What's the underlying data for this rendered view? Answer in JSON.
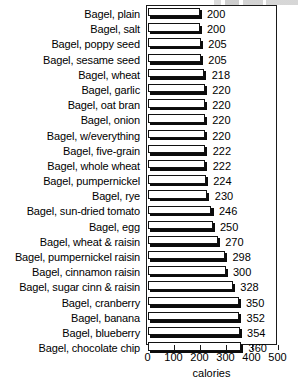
{
  "chart_data": {
    "type": "bar",
    "orientation": "horizontal",
    "title": "",
    "xlabel": "calories",
    "ylabel": "",
    "xlim": [
      0,
      500
    ],
    "xticks": [
      0,
      100,
      200,
      300,
      400,
      500
    ],
    "grid": false,
    "legend": null,
    "categories": [
      "Bagel, plain",
      "Bagel, salt",
      "Bagel, poppy seed",
      "Bagel, sesame seed",
      "Bagel, wheat",
      "Bagel, garlic",
      "Bagel, oat bran",
      "Bagel, onion",
      "Bagel, w/everything",
      "Bagel, five-grain",
      "Bagel, whole wheat",
      "Bagel, pumpernickel",
      "Bagel, rye",
      "Bagel, sun-dried tomato",
      "Bagel, egg",
      "Bagel, wheat & raisin",
      "Bagel, pumpernickel raisin",
      "Bagel, cinnamon raisin",
      "Bagel, sugar cinn & raisin",
      "Bagel, cranberry",
      "Bagel, banana",
      "Bagel, blueberry",
      "Bagel, chocolate chip"
    ],
    "values": [
      200,
      200,
      205,
      205,
      218,
      220,
      220,
      220,
      220,
      222,
      222,
      224,
      230,
      246,
      250,
      270,
      298,
      300,
      328,
      350,
      352,
      354,
      360
    ],
    "value_labels": [
      "200",
      "200",
      "205",
      "205",
      "218",
      "220",
      "220",
      "220",
      "220",
      "222",
      "222",
      "224",
      "230",
      "246",
      "250",
      "270",
      "298",
      "300",
      "328",
      "350",
      "352",
      "354",
      "360"
    ],
    "colors": {
      "bar_fill": "#ffffff",
      "bar_outline": "#111111",
      "bar_shadow": "#0b0b0b",
      "axis": "#1a1a1a",
      "text": "#000000",
      "background": "#ffffff"
    }
  }
}
